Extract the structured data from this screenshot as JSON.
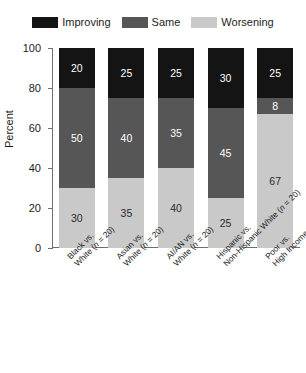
{
  "chart_data": {
    "type": "bar",
    "subtype": "stacked-bar-100",
    "title": "",
    "xlabel": "",
    "ylabel": "Percent",
    "ylim": [
      0,
      100
    ],
    "yticks": [
      0,
      20,
      40,
      60,
      80,
      100
    ],
    "grid": false,
    "legend_position": "top-center",
    "categories": [
      "Black vs. White (n = 20)",
      "Asian vs. White (n = 20)",
      "AI/AN vs. White (n = 20)",
      "Hispanic vs. Non-Hispanic White (n = 20)",
      "Poor vs. High Income (n = 12)"
    ],
    "category_lines": [
      [
        "Black vs.",
        "White (n = 20)"
      ],
      [
        "Asian vs.",
        "White (n = 20)"
      ],
      [
        "AI/AN vs.",
        "White (n = 20)"
      ],
      [
        "Hispanic vs.",
        "Non-Hispanic White (n = 20)"
      ],
      [
        "Poor vs.",
        "High Income (n = 12)"
      ]
    ],
    "series": [
      {
        "name": "Improving",
        "color": "#141414",
        "values": [
          20,
          25,
          25,
          30,
          25
        ]
      },
      {
        "name": "Same",
        "color": "#565656",
        "values": [
          50,
          40,
          35,
          45,
          8
        ]
      },
      {
        "name": "Worsening",
        "color": "#c9c9c9",
        "values": [
          30,
          35,
          40,
          25,
          67
        ]
      }
    ],
    "stack_order_bottom_to_top": [
      "Worsening",
      "Same",
      "Improving"
    ]
  },
  "legend": {
    "items": [
      {
        "label": "Improving",
        "color": "#141414"
      },
      {
        "label": "Same",
        "color": "#565656"
      },
      {
        "label": "Worsening",
        "color": "#c9c9c9"
      }
    ]
  },
  "axis": {
    "y_title": "Percent",
    "y_tick_labels": [
      "100",
      "80",
      "60",
      "40",
      "20",
      "0"
    ]
  },
  "colors": {
    "improving": "#141414",
    "same": "#565656",
    "worsening": "#c9c9c9",
    "axis": "#6e6e6e",
    "text": "#1c1c1c",
    "background": "#ffffff"
  }
}
